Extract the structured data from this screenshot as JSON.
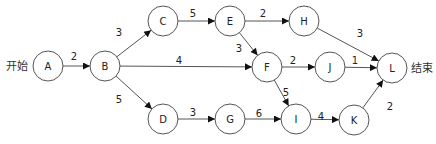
{
  "labels": {
    "start": "开始",
    "end": "结束"
  },
  "nodes": [
    {
      "id": "A",
      "x": 48,
      "y": 66
    },
    {
      "id": "B",
      "x": 105,
      "y": 66
    },
    {
      "id": "C",
      "x": 163,
      "y": 21
    },
    {
      "id": "D",
      "x": 163,
      "y": 119
    },
    {
      "id": "E",
      "x": 230,
      "y": 21
    },
    {
      "id": "F",
      "x": 267,
      "y": 67
    },
    {
      "id": "G",
      "x": 230,
      "y": 119
    },
    {
      "id": "H",
      "x": 304,
      "y": 21
    },
    {
      "id": "I",
      "x": 296,
      "y": 119
    },
    {
      "id": "J",
      "x": 330,
      "y": 67
    },
    {
      "id": "K",
      "x": 354,
      "y": 120
    },
    {
      "id": "L",
      "x": 392,
      "y": 68
    }
  ],
  "edges": [
    {
      "from": "A",
      "to": "B",
      "weight": "2",
      "lx": 74,
      "ly": 60
    },
    {
      "from": "B",
      "to": "C",
      "weight": "3",
      "lx": 119,
      "ly": 36
    },
    {
      "from": "B",
      "to": "F",
      "weight": "4",
      "lx": 179,
      "ly": 64
    },
    {
      "from": "B",
      "to": "D",
      "weight": "5",
      "lx": 119,
      "ly": 103
    },
    {
      "from": "C",
      "to": "E",
      "weight": "5",
      "lx": 193,
      "ly": 17
    },
    {
      "from": "D",
      "to": "G",
      "weight": "3",
      "lx": 193,
      "ly": 116
    },
    {
      "from": "E",
      "to": "H",
      "weight": "2",
      "lx": 263,
      "ly": 17
    },
    {
      "from": "E",
      "to": "F",
      "weight": "3",
      "lx": 239,
      "ly": 52
    },
    {
      "from": "G",
      "to": "I",
      "weight": "6",
      "lx": 259,
      "ly": 117
    },
    {
      "from": "F",
      "to": "J",
      "weight": "2",
      "lx": 293,
      "ly": 64
    },
    {
      "from": "F",
      "to": "I",
      "weight": "5",
      "lx": 286,
      "ly": 96
    },
    {
      "from": "H",
      "to": "L",
      "weight": "3",
      "lx": 360,
      "ly": 37
    },
    {
      "from": "J",
      "to": "L",
      "weight": "1",
      "lx": 355,
      "ly": 64
    },
    {
      "from": "I",
      "to": "K",
      "weight": "4",
      "lx": 321,
      "ly": 120
    },
    {
      "from": "K",
      "to": "L",
      "weight": "2",
      "lx": 390,
      "ly": 110
    }
  ]
}
